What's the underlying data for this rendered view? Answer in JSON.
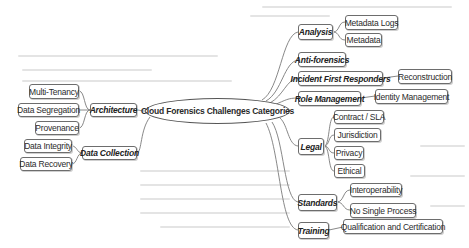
{
  "diagram": {
    "type": "mind-map",
    "center": {
      "label": "Cloud Forensics Challenges Categories"
    },
    "left_categories": [
      {
        "label": "Architecture",
        "children": [
          "Multi-Tenancy",
          "Data Segregation",
          "Provenance"
        ]
      },
      {
        "label": "Data Collection",
        "children": [
          "Data Integrity",
          "Data Recovery"
        ]
      }
    ],
    "right_categories": [
      {
        "label": "Analysis",
        "children": [
          "Metadata Logs",
          "Metadata"
        ]
      },
      {
        "label": "Anti-forensics",
        "children": []
      },
      {
        "label": "Incident First Responders",
        "children": [
          "Reconstruction"
        ]
      },
      {
        "label": "Role Management",
        "children": [
          "Identity Management"
        ]
      },
      {
        "label": "Legal",
        "children": [
          "Contract / SLA",
          "Jurisdiction",
          "Privacy",
          "Ethical"
        ]
      },
      {
        "label": "Standards",
        "children": [
          "Interoperability",
          "No Single Process"
        ]
      },
      {
        "label": "Training",
        "children": [
          "Qualification and Certification"
        ]
      }
    ],
    "colors": {
      "border": "#6d6d6d",
      "link": "#7a7a7a",
      "background": "#ffffff"
    }
  }
}
